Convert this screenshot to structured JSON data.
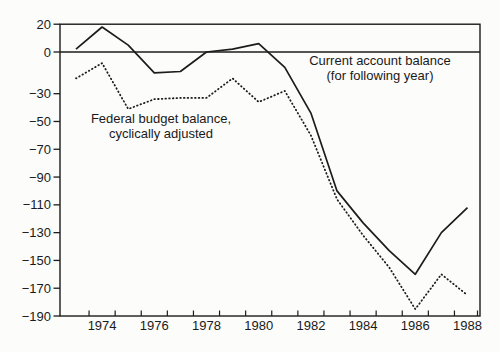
{
  "figure": {
    "background": "#fcfcfa",
    "line_color": "#1c1c1c",
    "text_color": "#1a1a1a"
  },
  "chart_data": {
    "type": "line",
    "title": "",
    "xlabel": "",
    "ylabel": "",
    "x": [
      1973,
      1974,
      1975,
      1976,
      1977,
      1978,
      1979,
      1980,
      1981,
      1982,
      1983,
      1984,
      1985,
      1986,
      1987,
      1988
    ],
    "x_tick_labels": [
      "1974",
      "1976",
      "1978",
      "1980",
      "1982",
      "1984",
      "1986",
      "1988"
    ],
    "y_ticks": [
      20,
      0,
      -30,
      -50,
      -70,
      -90,
      -110,
      -130,
      -150,
      -170,
      -190
    ],
    "y_tick_labels": [
      "20",
      "0",
      "−30",
      "−50",
      "−70",
      "−90",
      "−110",
      "−130",
      "−150",
      "−170",
      "−190"
    ],
    "ylim": [
      -190,
      20
    ],
    "grid": "zero-line-only",
    "legend_position": "inline-annotations",
    "series": [
      {
        "name": "Current account balance (for following year)",
        "style": "solid",
        "values": [
          2,
          18,
          5,
          -15,
          -14,
          0,
          2,
          6,
          -11,
          -44,
          -100,
          -123,
          -143,
          -160,
          -130,
          -112
        ]
      },
      {
        "name": "Federal budget balance, cyclically adjusted",
        "style": "dotted",
        "values": [
          -19,
          -8,
          -41,
          -34,
          -33,
          -33,
          -19,
          -36,
          -28,
          -60,
          -106,
          -132,
          -155,
          -185,
          -160,
          -175
        ]
      }
    ],
    "annotations": [
      {
        "line1": "Current account balance",
        "line2": "(for following year)"
      },
      {
        "line1": "Federal budget balance,",
        "line2": "cyclically adjusted"
      }
    ]
  }
}
